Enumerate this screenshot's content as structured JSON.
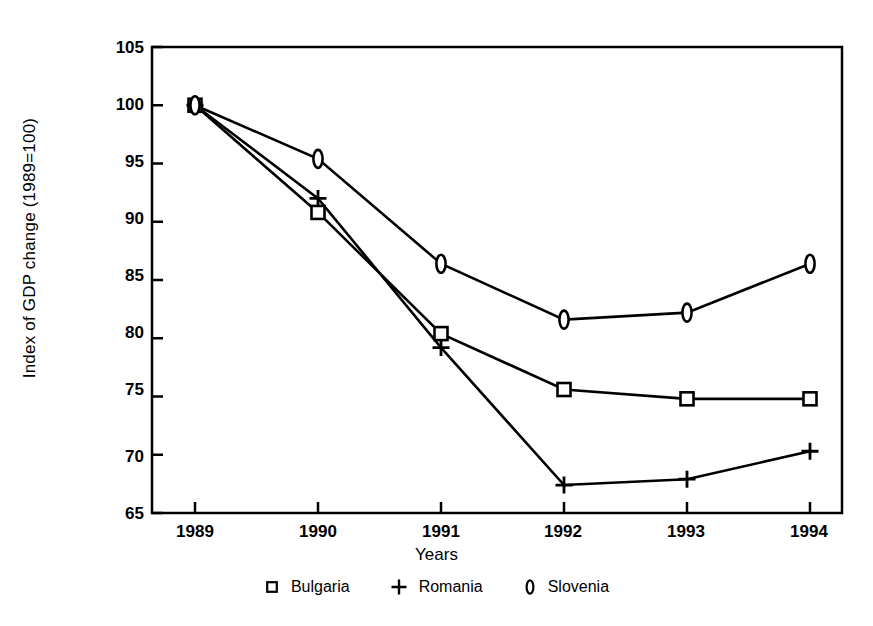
{
  "chart_data": {
    "type": "line",
    "title": "",
    "subtitle": "",
    "xlabel": "Years",
    "ylabel": "Index of GDP change (1989=100)",
    "categories": [
      "1989",
      "1990",
      "1991",
      "1992",
      "1993",
      "1994"
    ],
    "x": [
      1989,
      1990,
      1991,
      1992,
      1993,
      1994
    ],
    "xlim": [
      1988.6,
      1994.5
    ],
    "ylim": [
      65,
      105
    ],
    "yticks": [
      65,
      70,
      75,
      80,
      85,
      90,
      95,
      100,
      105
    ],
    "xticks": [
      "1989",
      "1990",
      "1991",
      "1992",
      "1993",
      "1994"
    ],
    "grid": false,
    "legend_position": "bottom",
    "series": [
      {
        "name": "Bulgaria",
        "marker": "square",
        "values": [
          100.0,
          90.8,
          80.4,
          75.6,
          74.8,
          74.8
        ]
      },
      {
        "name": "Romania",
        "marker": "plus",
        "values": [
          100.0,
          92.0,
          79.2,
          67.4,
          67.9,
          70.3
        ]
      },
      {
        "name": "Slovenia",
        "marker": "ellipse",
        "values": [
          100.0,
          95.4,
          86.4,
          81.6,
          82.2,
          86.4
        ]
      }
    ]
  },
  "axis": {
    "y_title": "Index of GDP change (1989=100)",
    "x_title": "Years",
    "y_tick_labels": [
      "105",
      "100",
      "95",
      "90",
      "85",
      "80",
      "75",
      "70",
      "65"
    ],
    "x_tick_labels": [
      "1989",
      "1990",
      "1991",
      "1992",
      "1993",
      "1994"
    ]
  },
  "legend": {
    "items": [
      {
        "label": "Bulgaria",
        "marker": "square-marker"
      },
      {
        "label": "Romania",
        "marker": "plus-marker"
      },
      {
        "label": "Slovenia",
        "marker": "ellipse-marker"
      }
    ]
  },
  "colors": {
    "line": "#000000",
    "background": "#ffffff",
    "axis": "#000000"
  }
}
